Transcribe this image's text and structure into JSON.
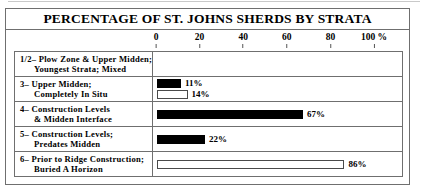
{
  "figure": {
    "title": "PERCENTAGE OF ST. JOHNS SHERDS BY STRATA"
  },
  "axis": {
    "unit_suffix": "%",
    "ticks": [
      {
        "label": "0",
        "value": 0
      },
      {
        "label": "20",
        "value": 20
      },
      {
        "label": "40",
        "value": 40
      },
      {
        "label": "60",
        "value": 60
      },
      {
        "label": "80",
        "value": 80
      },
      {
        "label": "100 %",
        "value": 100
      }
    ]
  },
  "rows": [
    {
      "label_line1": "1/2– Plow Zone & Upper Midden;",
      "label_line2": "Youngest Strata; Mixed",
      "bars": []
    },
    {
      "label_line1": "3– Upper Midden;",
      "label_line2": "Completely In Situ",
      "bars": [
        {
          "value": 11,
          "value_label": "11%",
          "style": "filled"
        },
        {
          "value": 14,
          "value_label": "14%",
          "style": "hollow"
        }
      ]
    },
    {
      "label_line1": "4– Construction Levels",
      "label_line2": "& Midden Interface",
      "bars": [
        {
          "value": 67,
          "value_label": "67%",
          "style": "filled"
        }
      ]
    },
    {
      "label_line1": "5– Construction Levels;",
      "label_line2": "Predates Midden",
      "bars": [
        {
          "value": 22,
          "value_label": "22%",
          "style": "filled"
        }
      ]
    },
    {
      "label_line1": "6– Prior to Ridge Construction;",
      "label_line2": "Buried A Horizon",
      "bars": [
        {
          "value": 86,
          "value_label": "86%",
          "style": "hollow"
        }
      ]
    }
  ],
  "chart_data": {
    "type": "bar",
    "orientation": "horizontal",
    "title": "PERCENTAGE OF ST. JOHNS SHERDS BY STRATA",
    "xlabel": "%",
    "ylabel": "",
    "xlim": [
      0,
      100
    ],
    "xticks": [
      0,
      20,
      40,
      60,
      80,
      100
    ],
    "grid": false,
    "legend": "none",
    "categories": [
      "1/2– Plow Zone & Upper Midden; Youngest Strata; Mixed",
      "3– Upper Midden; Completely In Situ",
      "4– Construction Levels & Midden Interface",
      "5– Construction Levels; Predates Midden",
      "6– Prior to Ridge Construction; Buried A Horizon"
    ],
    "series": [
      {
        "name": "filled",
        "values": [
          null,
          11,
          67,
          22,
          null
        ]
      },
      {
        "name": "hollow",
        "values": [
          null,
          14,
          null,
          null,
          86
        ]
      }
    ],
    "data_labels": [
      [],
      [
        "11%",
        "14%"
      ],
      [
        "67%"
      ],
      [
        "22%"
      ],
      [
        "86%"
      ]
    ]
  }
}
